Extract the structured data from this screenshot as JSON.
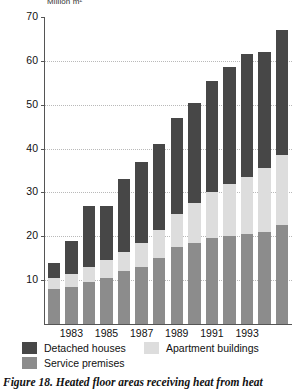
{
  "figure": {
    "caption": "Figure 18.  Heated floor areas receiving heat from heat",
    "unit_label": "Million m²"
  },
  "legend": {
    "items": [
      {
        "label": "Detached houses",
        "color": "#474747",
        "key": "detached"
      },
      {
        "label": "Apartment buildings",
        "color": "#dddddd",
        "key": "apartment"
      },
      {
        "label": "Service premises",
        "color": "#8c8c8c",
        "key": "service"
      }
    ]
  },
  "axis": {
    "y_ticks": [
      "10",
      "20",
      "30",
      "40",
      "50",
      "60",
      "70"
    ],
    "x_ticks": [
      "1983",
      "1985",
      "1987",
      "1989",
      "1991",
      "1993"
    ]
  },
  "chart_data": {
    "type": "bar",
    "subtype": "stacked",
    "title": "Figure 18.  Heated floor areas receiving heat from heat",
    "xlabel": "",
    "ylabel": "Million m²",
    "ylim": [
      0,
      70
    ],
    "grid": true,
    "legend_position": "bottom",
    "categories": [
      "1982",
      "1983",
      "1984",
      "1985",
      "1986",
      "1987",
      "1988",
      "1989",
      "1990",
      "1991",
      "1992",
      "1993",
      "1994",
      "1995"
    ],
    "labeled_categories": [
      "1983",
      "1985",
      "1987",
      "1989",
      "1991",
      "1993"
    ],
    "series": [
      {
        "name": "Service premises",
        "color": "#8c8c8c",
        "values": [
          8,
          8.5,
          9.5,
          10.5,
          12,
          13,
          15,
          17.5,
          18.5,
          19.5,
          20,
          20.5,
          21,
          22.5
        ]
      },
      {
        "name": "Apartment buildings",
        "color": "#dddddd",
        "values": [
          2.5,
          3,
          3.5,
          4,
          4.5,
          5.5,
          6.5,
          7.5,
          9,
          10.5,
          12,
          13,
          14.5,
          16
        ]
      },
      {
        "name": "Detached houses",
        "color": "#474747",
        "values": [
          3.5,
          7.5,
          14,
          12.5,
          16.5,
          18.5,
          19.5,
          22,
          23,
          25.5,
          26.5,
          28,
          26.5,
          28.5
        ]
      }
    ],
    "totals": [
      14,
      19,
      27,
      27,
      33,
      37,
      41,
      47,
      50.5,
      55.5,
      58.5,
      61.5,
      62,
      67
    ]
  }
}
